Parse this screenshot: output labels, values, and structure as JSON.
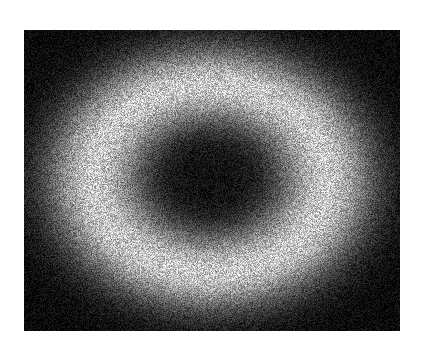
{
  "figure": {
    "kind": "raster-density-image",
    "title": "",
    "canvas_width": 423,
    "canvas_height": 359,
    "background_color": "#ffffff"
  },
  "plot_area": {
    "x": 24,
    "y": 30,
    "width": 376,
    "height": 301,
    "border": "none",
    "axes_visible": false,
    "ticks_visible": false,
    "gridlines_visible": false
  },
  "chart_data": {
    "type": "heatmap",
    "title": "",
    "subtitle": "",
    "xlabel": "",
    "ylabel": "",
    "colormap": "gray",
    "grid": false,
    "legend": "none",
    "colorbar": false,
    "xlim": [
      0,
      376
    ],
    "ylim": [
      0,
      301
    ],
    "pixel_grid": {
      "cols": 376,
      "rows": 301
    },
    "value_range": [
      0,
      255
    ],
    "model": {
      "description": "Elliptical annulus intensity field with additive uniform pixel noise",
      "center_x": 186,
      "center_y": 148,
      "sigma_x": 118,
      "sigma_y": 95,
      "ring_radius": 0.96,
      "ring_width": 0.62,
      "peak_value": 212,
      "core_value": 16,
      "floor_value": 10,
      "noise_amplitude": 86,
      "noise_seed": 20240613
    },
    "radial_profile": {
      "r_normalized": [
        0.0,
        0.2,
        0.4,
        0.6,
        0.8,
        0.96,
        1.2,
        1.5,
        1.9,
        2.4,
        3.0
      ],
      "mean_intensity": [
        16,
        22,
        44,
        92,
        160,
        212,
        188,
        126,
        62,
        26,
        12
      ]
    },
    "horizontal_scanline_center": {
      "y_pixel": 178,
      "x_pixels": [
        24,
        50,
        70,
        90,
        105,
        120,
        140,
        160,
        185,
        210,
        235,
        260,
        285,
        305,
        320,
        340,
        365,
        399
      ],
      "mean_intensity": [
        20,
        52,
        110,
        185,
        206,
        196,
        140,
        72,
        26,
        16,
        26,
        74,
        146,
        200,
        204,
        172,
        86,
        22
      ]
    },
    "vertical_scanline_center": {
      "x_pixel": 210,
      "y_pixels": [
        30,
        50,
        70,
        90,
        108,
        125,
        145,
        160,
        180,
        200,
        215,
        235,
        255,
        272,
        290,
        310,
        331
      ],
      "mean_intensity": [
        18,
        46,
        104,
        172,
        204,
        190,
        118,
        58,
        16,
        24,
        64,
        140,
        198,
        192,
        132,
        58,
        20
      ]
    },
    "features": [
      {
        "name": "dark-core",
        "shape": "ellipse",
        "center": [
          210,
          180
        ],
        "half_width": 60,
        "half_height": 36,
        "mean_value": 18
      },
      {
        "name": "bright-ring-left",
        "center": [
          105,
          180
        ],
        "mean_value": 205
      },
      {
        "name": "bright-ring-right",
        "center": [
          315,
          180
        ],
        "mean_value": 203
      },
      {
        "name": "bright-ring-top",
        "center": [
          210,
          108
        ],
        "mean_value": 202
      },
      {
        "name": "bright-ring-bottom",
        "center": [
          210,
          254
        ],
        "mean_value": 198
      },
      {
        "name": "dark-corner-top-left",
        "center": [
          40,
          45
        ],
        "mean_value": 14
      },
      {
        "name": "dark-corner-top-right",
        "center": [
          385,
          45
        ],
        "mean_value": 15
      },
      {
        "name": "dark-corner-bottom-left",
        "center": [
          40,
          318
        ],
        "mean_value": 14
      },
      {
        "name": "dark-corner-bottom-right",
        "center": [
          385,
          318
        ],
        "mean_value": 15
      }
    ]
  },
  "colors": {
    "background": "#ffffff",
    "min": "#000000",
    "max": "#ffffff",
    "ring_peak": "#d4d4d4",
    "core": "#101010"
  }
}
